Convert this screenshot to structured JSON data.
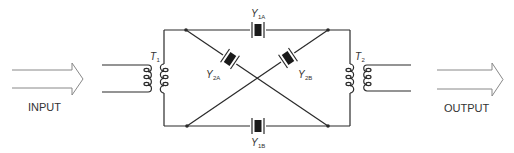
{
  "diagram": {
    "type": "crystal lattice filter schematic",
    "input_label": "INPUT",
    "output_label": "OUTPUT",
    "components": {
      "t1": {
        "letter": "T",
        "sub": "1"
      },
      "t2": {
        "letter": "T",
        "sub": "2"
      },
      "y1a": {
        "letter": "Y",
        "sub": "1A"
      },
      "y1b": {
        "letter": "Y",
        "sub": "1B"
      },
      "y2a": {
        "letter": "Y",
        "sub": "2A"
      },
      "y2b": {
        "letter": "Y",
        "sub": "2B"
      }
    },
    "colors": {
      "line": "#2a2a2a",
      "text": "#333333",
      "arrow": "#888888"
    }
  }
}
